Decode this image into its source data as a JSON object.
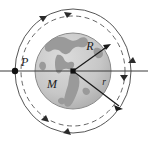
{
  "figure": {
    "name": "orbit-diagram",
    "caption_labels": {
      "point_p": "P",
      "central_mass": "M",
      "earth_radius": "R",
      "orbit_radius": "r"
    },
    "colors": {
      "background": "#ffffff",
      "ocean": "#c9c9c9",
      "land": "#9a9a9a",
      "globe_edge": "#8a8a8a",
      "line": "#3a3a3a",
      "orbit_solid": "#555555",
      "orbit_dashed": "#666666",
      "marker": "#111111",
      "label": "#1a1a1a"
    },
    "geometry": {
      "center_x": 73,
      "center_y": 71,
      "earth_radius_px": 38,
      "solid_orbit_rx": 58,
      "solid_orbit_ry": 62,
      "dashed_orbit_rx": 52,
      "dashed_orbit_ry": 55,
      "point_p_x": 15,
      "point_p_y": 71,
      "r_vector_end_x": 122,
      "r_vector_end_y": 108,
      "R_vector_end_x": 110,
      "R_vector_end_y": 45
    },
    "elements": {
      "horizontal_axis": "axis-line",
      "direction": "clockwise",
      "arrow_count": 6
    }
  }
}
